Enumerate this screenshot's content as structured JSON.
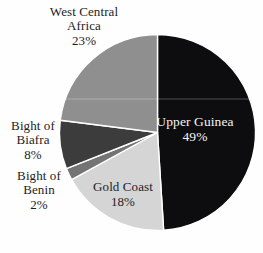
{
  "chart_data": {
    "type": "pie",
    "title": "",
    "unit": "%",
    "order": "clockwise",
    "start_angle_deg": 0,
    "legend": "none",
    "slices": [
      {
        "label": "Upper Guinea",
        "value": 49,
        "color": "#0d0d0f",
        "label_color": "#f5f5f5",
        "label_inside": true
      },
      {
        "label": "Gold Coast",
        "value": 18,
        "color": "#d5d5d5",
        "label_color": "#1d1d1d",
        "label_inside": true
      },
      {
        "label": "Bight of Benin",
        "value": 2,
        "color": "#747474",
        "label_color": "#1d1d1d",
        "label_inside": false
      },
      {
        "label": "Bight of Biafra",
        "value": 8,
        "color": "#3c3c3c",
        "label_color": "#1d1d1d",
        "label_inside": false
      },
      {
        "label": "West Central Africa",
        "value": 23,
        "color": "#8f8f8f",
        "label_color": "#1d1d1d",
        "label_inside": false
      }
    ]
  },
  "labels": {
    "west_central_africa": {
      "line1": "West Central",
      "line2": "Africa",
      "pct": "23%"
    },
    "upper_guinea": {
      "line1": "Upper Guinea",
      "pct": "49%"
    },
    "bight_of_biafra": {
      "line1": "Bight of",
      "line2": "Biafra",
      "pct": "8%"
    },
    "bight_of_benin": {
      "line1": "Bight of",
      "line2": "Benin",
      "pct": "2%"
    },
    "gold_coast": {
      "line1": "Gold Coast",
      "pct": "18%"
    }
  }
}
